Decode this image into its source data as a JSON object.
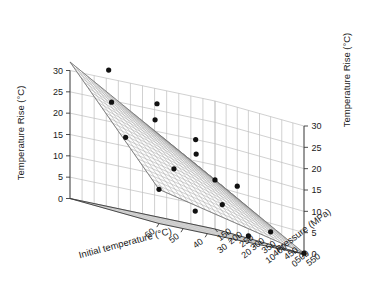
{
  "figure": {
    "kind": "3d-surface-plot",
    "background_color": "#ffffff",
    "surface_fill": "#fdfdfd",
    "surface_mesh_color": "#9a9a9a",
    "grid_color": "#bdbdbd",
    "axis_color": "#3a3a3a",
    "marker_color": "#111111"
  },
  "axes": {
    "x": {
      "title": "Initial temperature (°C)",
      "ticks": [
        "60",
        "50",
        "40",
        "30",
        "20",
        "10",
        "0"
      ],
      "values": [
        60,
        50,
        40,
        30,
        20,
        10,
        0
      ],
      "range": [
        60,
        0
      ]
    },
    "y": {
      "title": "Pressure (MPa)",
      "ticks": [
        "150",
        "200",
        "250",
        "300",
        "350",
        "400",
        "450",
        "500",
        "550"
      ],
      "values": [
        150,
        200,
        250,
        300,
        350,
        400,
        450,
        500,
        550
      ],
      "range": [
        150,
        550
      ]
    },
    "z_left": {
      "title": "Temperature Rise (°C)",
      "ticks": [
        "0",
        "5",
        "10",
        "15",
        "20",
        "25",
        "30"
      ],
      "values": [
        0,
        5,
        10,
        15,
        20,
        25,
        30
      ],
      "range": [
        0,
        30
      ]
    },
    "z_right": {
      "title": "Temperature Rise (°C)",
      "ticks": [
        "0",
        "5",
        "10",
        "15",
        "20",
        "25",
        "30"
      ],
      "values": [
        0,
        5,
        10,
        15,
        20,
        25,
        30
      ],
      "range": [
        0,
        30
      ]
    }
  },
  "chart_data": {
    "type": "scatter",
    "subtype": "3d-surface-with-scatter",
    "title": "",
    "xlabel": "Initial temperature (°C)",
    "ylabel": "Pressure (MPa)",
    "zlabel": "Temperature Rise (°C)",
    "xlim": [
      0,
      60
    ],
    "ylim": [
      150,
      550
    ],
    "zlim": [
      0,
      30
    ],
    "grid": true,
    "legend": false,
    "x": [
      60,
      50,
      40,
      30,
      20,
      10,
      0
    ],
    "y": [
      150,
      200,
      250,
      300,
      350,
      400,
      450,
      500,
      550
    ],
    "surface_note": "Planar-to-slightly-curved regression surface rising toward high pressure and low initial temperature",
    "points": [
      {
        "x": 60,
        "y": 550,
        "z": 8.0
      },
      {
        "x": 45,
        "y": 550,
        "z": 4.7
      },
      {
        "x": 23,
        "y": 550,
        "z": 1.5
      },
      {
        "x": 0,
        "y": 550,
        "z": 0.2
      },
      {
        "x": 60,
        "y": 400,
        "z": 18.0
      },
      {
        "x": 40,
        "y": 400,
        "z": 13.0
      },
      {
        "x": 20,
        "y": 400,
        "z": 7.0
      },
      {
        "x": 0,
        "y": 400,
        "z": 3.0
      },
      {
        "x": 52,
        "y": 250,
        "z": 25.0
      },
      {
        "x": 34,
        "y": 250,
        "z": 23.0
      },
      {
        "x": 17,
        "y": 250,
        "z": 17.0
      },
      {
        "x": 0,
        "y": 250,
        "z": 11.5
      },
      {
        "x": 44,
        "y": 150,
        "z": 32.0
      },
      {
        "x": 24,
        "y": 150,
        "z": 26.5
      },
      {
        "x": 8,
        "y": 150,
        "z": 20.0
      },
      {
        "x": 0,
        "y": 150,
        "z": 11.5
      }
    ],
    "surface_grid": {
      "nx": 25,
      "ny": 25,
      "corner_values": {
        "x60_y150": 32.0,
        "x0_y150": 11.5,
        "x60_y550": 8.0,
        "x0_y550": 0.2
      }
    }
  }
}
